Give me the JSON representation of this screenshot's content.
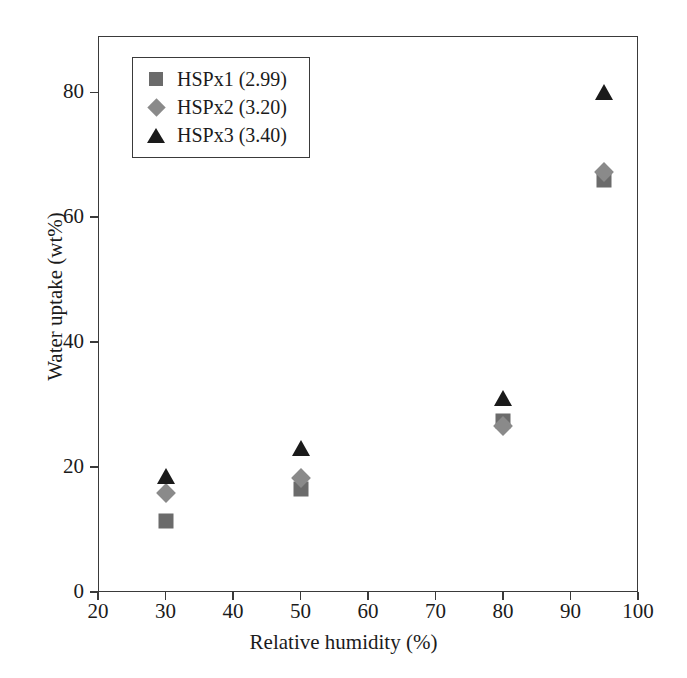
{
  "chart_data": {
    "type": "scatter",
    "title": "",
    "xlabel": "Relative humidity (%)",
    "ylabel": "Water uptake (wt%)",
    "xlim": [
      20,
      100
    ],
    "ylim": [
      0,
      89
    ],
    "xticks": [
      20,
      30,
      40,
      50,
      60,
      70,
      80,
      90,
      100
    ],
    "yticks": [
      0,
      20,
      40,
      60,
      80
    ],
    "grid": false,
    "legend_position": "upper-left-inside",
    "series": [
      {
        "name": "HSPx1 (2.99)",
        "marker": "square",
        "color": "#6b6b6b",
        "x": [
          30,
          50,
          80,
          95
        ],
        "values": [
          11.3,
          16.5,
          27.4,
          65.9
        ]
      },
      {
        "name": "HSPx2 (3.20)",
        "marker": "diamond",
        "color": "#8a8a8a",
        "x": [
          30,
          50,
          80,
          95
        ],
        "values": [
          15.8,
          18.3,
          26.6,
          67.3
        ]
      },
      {
        "name": "HSPx3 (3.40)",
        "marker": "triangle",
        "color": "#1a1a1a",
        "x": [
          30,
          50,
          80,
          95
        ],
        "values": [
          18.5,
          23.0,
          31.0,
          80.0
        ]
      }
    ]
  },
  "axis": {
    "frame_color": "#3a3a3a"
  }
}
